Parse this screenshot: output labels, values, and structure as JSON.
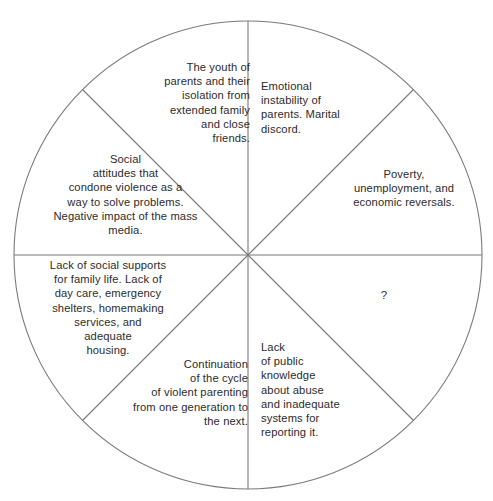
{
  "diagram": {
    "type": "wheel",
    "title": "",
    "shape": {
      "center_x": 248,
      "center_y": 255,
      "radius": 234,
      "segment_count": 8,
      "line_color": "#7a7a7a",
      "fill_color": "#ffffff"
    },
    "segments": [
      {
        "id": "emotional-instability",
        "position": "top-right",
        "align": "left",
        "text": "Emotional\ninstability of\nparents. Marital\ndiscord."
      },
      {
        "id": "poverty-unemployment",
        "position": "right-upper",
        "align": "center",
        "text": "Poverty,\nunemployment, and\neconomic reversals."
      },
      {
        "id": "question-mark",
        "position": "right-lower",
        "align": "center",
        "text": "?"
      },
      {
        "id": "lack-public-knowledge",
        "position": "bottom-right",
        "align": "left",
        "text": "Lack\nof public\nknowledge\nabout abuse\nand inadequate\nsystems for\nreporting it."
      },
      {
        "id": "continuation-cycle",
        "position": "bottom-left",
        "align": "right",
        "text": "Continuation\nof the cycle\nof violent parenting\nfrom one generation to\nthe next."
      },
      {
        "id": "lack-social-supports",
        "position": "left-lower",
        "align": "center",
        "text": "Lack of social supports\nfor family life. Lack of\nday care, emergency\nshelters, homemaking\nservices, and\nadequate\nhousing."
      },
      {
        "id": "social-attitudes",
        "position": "left-upper",
        "align": "center",
        "text": "Social\nattitudes that\ncondone violence as a\nway to solve problems.\nNegative impact of the mass\nmedia."
      },
      {
        "id": "youth-isolation",
        "position": "top-left",
        "align": "right",
        "text": "The youth of\nparents and their\nisolation from\nextended family\nand close\nfriends."
      }
    ]
  }
}
